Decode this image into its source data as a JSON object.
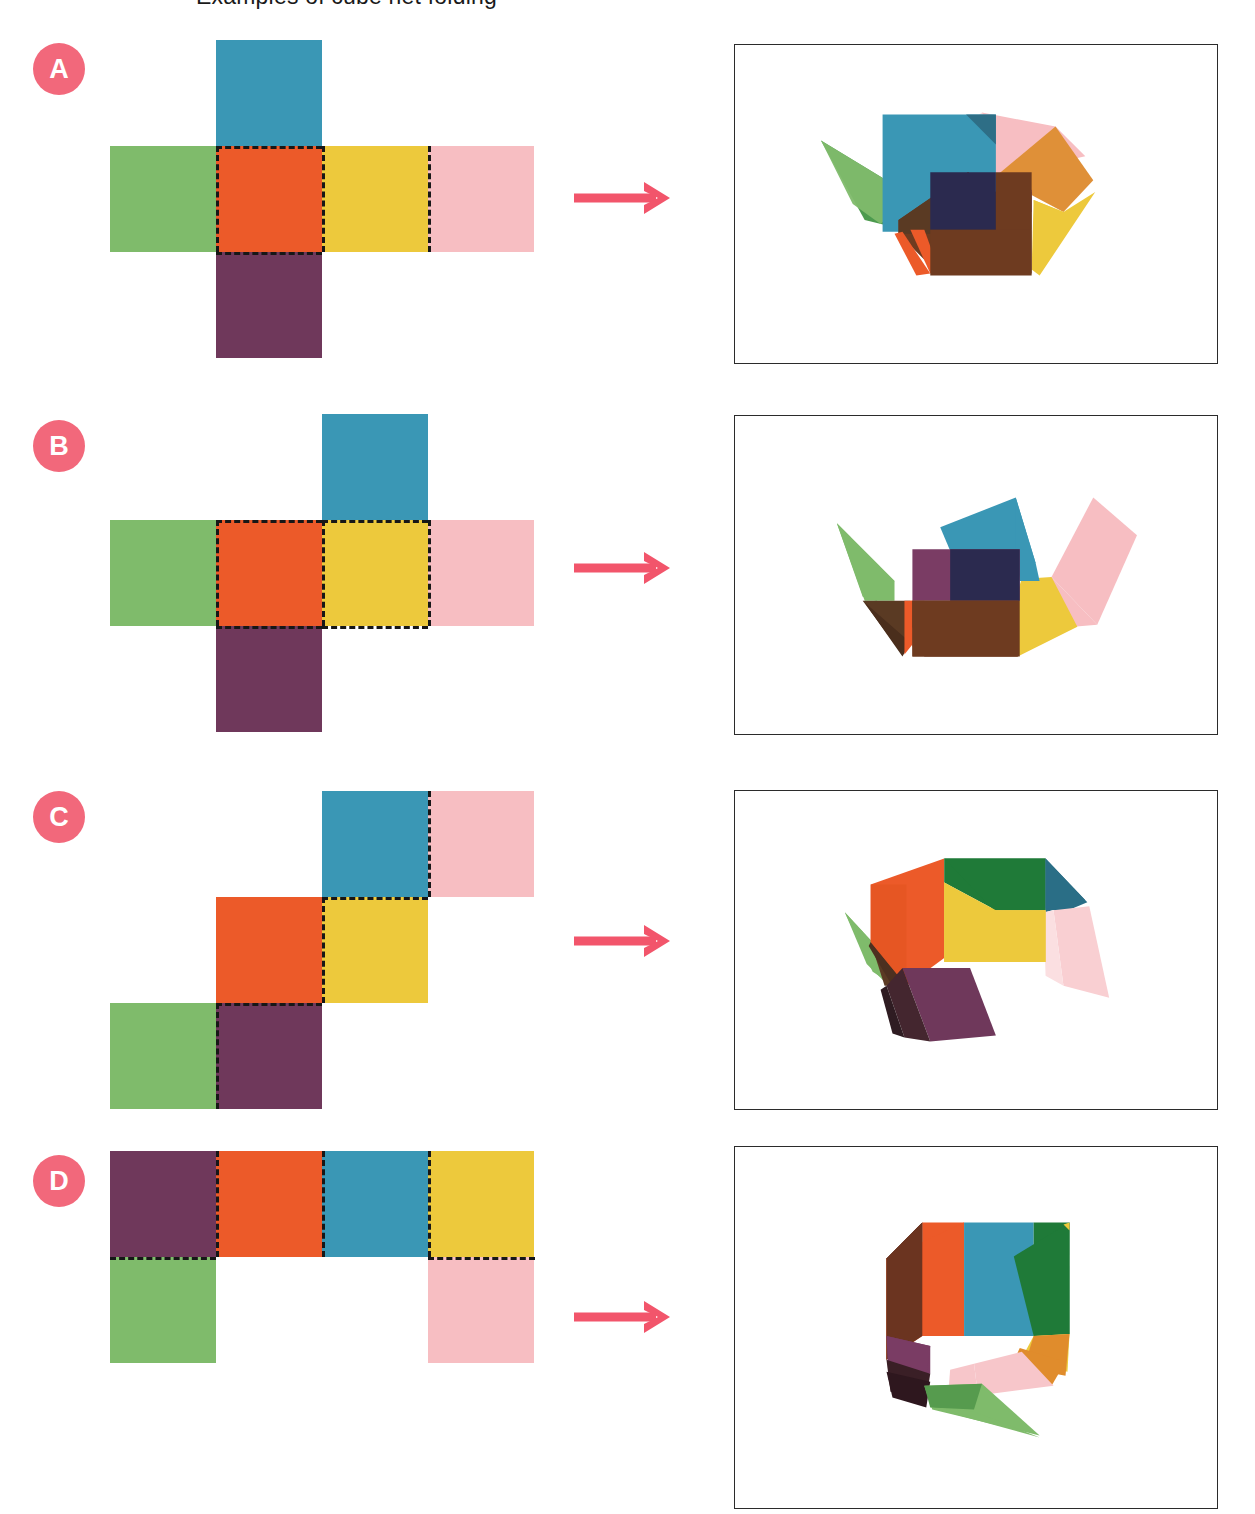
{
  "header": {
    "clipped_text": "Examples of cube net folding"
  },
  "palette": {
    "green": "#7FBB6B",
    "blue": "#3A97B5",
    "orange": "#EC5A29",
    "yellow": "#EDC93C",
    "pink": "#F7BEC2",
    "purple": "#6F385B",
    "badge": "#F2687B",
    "arrow": "#F2556B",
    "panel_border": "#2b2b2b",
    "fold_line": "#171717",
    "background": "#ffffff"
  },
  "color_names": [
    "green",
    "blue",
    "orange",
    "yellow",
    "pink",
    "purple"
  ],
  "rows": [
    {
      "id": "A",
      "badge_label": "A",
      "net_name": "cross-net",
      "net_description": "Latin-cross / plus shaped net: horizontal strip of green, orange, yellow, pink with blue above orange and purple below orange.",
      "net_cells": [
        {
          "color": "blue",
          "col": 2,
          "row": 1
        },
        {
          "color": "green",
          "col": 1,
          "row": 2
        },
        {
          "color": "orange",
          "col": 2,
          "row": 2
        },
        {
          "color": "yellow",
          "col": 3,
          "row": 2
        },
        {
          "color": "pink",
          "col": 4,
          "row": 2
        },
        {
          "color": "purple",
          "col": 2,
          "row": 3
        }
      ],
      "fold_lines": "dashed outline around orange square plus vertical dash between yellow and pink",
      "arrow_label": "folds into",
      "render_name": "folded-cube-render-a",
      "render_description": "Nearly closed cube seen from above-front; blue top face, dark brown front, yellow and orange right flaps, green spike at left, pink flap at upper right."
    },
    {
      "id": "B",
      "badge_label": "B",
      "net_name": "cross-net-shifted",
      "net_description": "Plus shaped net with the blue square above the yellow square instead of above the orange square.",
      "net_cells": [
        {
          "color": "blue",
          "col": 3,
          "row": 1
        },
        {
          "color": "green",
          "col": 1,
          "row": 2
        },
        {
          "color": "orange",
          "col": 2,
          "row": 2
        },
        {
          "color": "yellow",
          "col": 3,
          "row": 2
        },
        {
          "color": "pink",
          "col": 4,
          "row": 2
        },
        {
          "color": "purple",
          "col": 2,
          "row": 3
        }
      ],
      "fold_lines": "dashed outlines around both orange and yellow squares",
      "arrow_label": "folds into",
      "render_name": "folded-cube-render-b",
      "render_description": "Open bowl shape; brown base, purple and navy inner walls, blue flap raised at back, pink flap swung out right, green spike at left, yellow wedge at right."
    },
    {
      "id": "C",
      "badge_label": "C",
      "net_name": "staircase-net",
      "net_description": "Zig-zag staircase net of three stacked dominoes: blue-pink on top row, orange-yellow in the middle row, green-purple on the bottom row.",
      "net_cells": [
        {
          "color": "blue",
          "col": 3,
          "row": 1
        },
        {
          "color": "pink",
          "col": 4,
          "row": 1
        },
        {
          "color": "orange",
          "col": 2,
          "row": 2
        },
        {
          "color": "yellow",
          "col": 3,
          "row": 2
        },
        {
          "color": "green",
          "col": 1,
          "row": 3
        },
        {
          "color": "purple",
          "col": 2,
          "row": 3
        }
      ],
      "fold_lines": "dashed lines between blue and pink, under blue, between orange and yellow, under orange, between green and purple",
      "arrow_label": "folds into",
      "render_name": "folded-cube-render-c",
      "render_description": "Half folded corner; orange left face, yellow front face, dark green top face, purple flap hanging at bottom, blue wedge and translucent pink flap at right, green spike at left."
    },
    {
      "id": "D",
      "badge_label": "D",
      "net_name": "strip-net",
      "net_description": "Four-in-a-row strip of purple, orange, blue, yellow with green hanging below the purple square and pink hanging below the yellow square.",
      "net_cells": [
        {
          "color": "purple",
          "col": 1,
          "row": 1
        },
        {
          "color": "orange",
          "col": 2,
          "row": 1
        },
        {
          "color": "blue",
          "col": 3,
          "row": 1
        },
        {
          "color": "yellow",
          "col": 4,
          "row": 1
        },
        {
          "color": "green",
          "col": 1,
          "row": 2
        },
        {
          "color": "pink",
          "col": 4,
          "row": 2
        }
      ],
      "fold_lines": "dashed verticals between purple/orange, orange/blue, blue/yellow and dashed horizontals under purple and under yellow",
      "arrow_label": "folds into",
      "render_name": "folded-cube-render-d",
      "render_description": "Almost closed cube with open bottom; orange and blue front faces, dark green right face, dark brown left face, orange-tan and pink flaps plus a green spike dangling below."
    }
  ]
}
